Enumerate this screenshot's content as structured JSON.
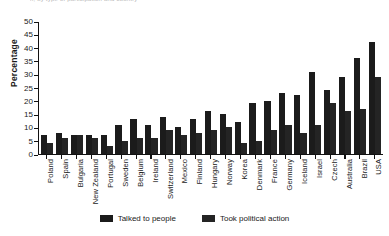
{
  "chart_data": {
    "type": "bar",
    "title": "",
    "cropped_title_fragment": "n, by type of participation and country",
    "xlabel": "",
    "ylabel": "Percentage",
    "ylim": [
      0,
      50
    ],
    "yticks": [
      50,
      45,
      40,
      35,
      30,
      25,
      20,
      15,
      10,
      5,
      0
    ],
    "grid": false,
    "legend_position": "bottom",
    "categories": [
      "Poland",
      "Spain",
      "Bulgaria",
      "New Zealand",
      "Portugal",
      "Sweden",
      "Belgium",
      "Ireland",
      "Switzerland",
      "Mexico",
      "Finland",
      "Hungary",
      "Norway",
      "Korea",
      "Denmark",
      "France",
      "Germany",
      "Iceland",
      "Israel",
      "Czech",
      "Australia",
      "Brazil",
      "USA"
    ],
    "series": [
      {
        "name": "Talked to people",
        "color": "#1b1b1b",
        "values": [
          7,
          8,
          7,
          7,
          7,
          11,
          13,
          11,
          14,
          10,
          13,
          16,
          15,
          12,
          19,
          20,
          23,
          22,
          31,
          24,
          29,
          36,
          42
        ]
      },
      {
        "name": "Took political action",
        "color": "#242424",
        "values": [
          4,
          6,
          7,
          6,
          3,
          5,
          6,
          6,
          9,
          7,
          8,
          9,
          10,
          4,
          5,
          9,
          11,
          8,
          11,
          19,
          16,
          17,
          29
        ]
      }
    ]
  },
  "legend": {
    "items": [
      {
        "label": "Talked to people"
      },
      {
        "label": "Took political action"
      }
    ]
  }
}
